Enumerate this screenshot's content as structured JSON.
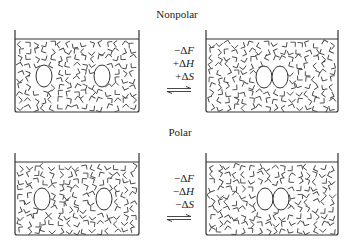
{
  "panels": [
    {
      "id": "nonpolar",
      "title": "Nonpolar",
      "thermo": [
        {
          "sign": "−",
          "symbol": "Δ",
          "var": "F"
        },
        {
          "sign": "+",
          "symbol": "Δ",
          "var": "H"
        },
        {
          "sign": "+",
          "symbol": "Δ",
          "var": "S"
        }
      ],
      "arrow": "equilibrium-arrows",
      "left_state": "two separated solute molecules with ordered solvent cages",
      "right_state": "two associated solute molecules"
    },
    {
      "id": "polar",
      "title": "Polar",
      "thermo": [
        {
          "sign": "−",
          "symbol": "Δ",
          "var": "F"
        },
        {
          "sign": "−",
          "symbol": "Δ",
          "var": "H"
        },
        {
          "sign": "−",
          "symbol": "Δ",
          "var": "S"
        }
      ],
      "arrow": "equilibrium-arrows",
      "left_state": "two separated solute molecules",
      "right_state": "two associated solute molecules"
    }
  ],
  "colors": {
    "line": "#333333",
    "background": "#ffffff"
  }
}
